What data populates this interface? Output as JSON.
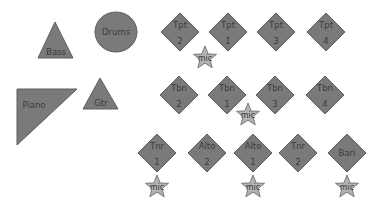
{
  "diagram": {
    "title": "",
    "colors": {
      "instrument_fill": "#7a7a7a",
      "instrument_stroke": "#5e5e5e",
      "mic_fill": "#b3b3b3",
      "mic_stroke": "#7a7a7a",
      "label": "#3a3a3a",
      "background": "#ffffff"
    },
    "rhythm": {
      "bass": {
        "label": "Bass",
        "shape": "triangle"
      },
      "drums": {
        "label": "Drums",
        "shape": "circle"
      },
      "piano": {
        "label": "Piano",
        "shape": "right-triangle"
      },
      "guitar": {
        "label": "Gtr",
        "shape": "triangle"
      }
    },
    "trumpets": [
      {
        "label": "Tpt",
        "number": "2"
      },
      {
        "label": "Tpt",
        "number": "1"
      },
      {
        "label": "Tpt",
        "number": "3"
      },
      {
        "label": "Tpt",
        "number": "4"
      }
    ],
    "trombones": [
      {
        "label": "Tbn",
        "number": "2"
      },
      {
        "label": "Tbn",
        "number": "1"
      },
      {
        "label": "Tbn",
        "number": "3"
      },
      {
        "label": "Tbn",
        "number": "4"
      }
    ],
    "saxes": [
      {
        "label": "Tnr",
        "number": "1"
      },
      {
        "label": "Alto",
        "number": "2"
      },
      {
        "label": "Alto",
        "number": "1"
      },
      {
        "label": "Tnr",
        "number": "2"
      },
      {
        "label": "Bari",
        "number": ""
      }
    ],
    "mics": [
      {
        "label": "mic",
        "near": "Tpt 1"
      },
      {
        "label": "mic",
        "near": "Tbn 1"
      },
      {
        "label": "mic",
        "near": "Tnr 1"
      },
      {
        "label": "mic",
        "near": "Alto 1"
      },
      {
        "label": "mic",
        "near": "Bari"
      }
    ]
  }
}
